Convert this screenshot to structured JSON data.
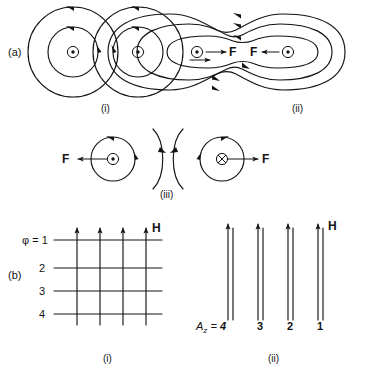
{
  "figure": {
    "panels": {
      "a": {
        "label": "(a)",
        "sub_i": {
          "caption": "(i)",
          "description": "two-parallel-currents-separate-field-circles",
          "current_symbols": [
            "dot-out-of-page",
            "dot-out-of-page"
          ],
          "circulation": "counterclockwise"
        },
        "sub_ii": {
          "caption": "(ii)",
          "description": "merged-field-contours-attraction",
          "force_label_left": "F",
          "force_label_right": "F",
          "current_symbols": [
            "dot-out-of-page",
            "dot-out-of-page"
          ],
          "force_direction": "inward-attraction"
        },
        "sub_iii": {
          "caption": "(iii)",
          "description": "antiparallel-currents-repulsion",
          "force_label_left": "F",
          "force_label_right": "F",
          "current_symbol_left": "dot-out-of-page",
          "current_symbol_right": "cross-into-page",
          "force_direction": "outward-repulsion"
        },
        "transition_arrow": "arrow-right"
      },
      "b": {
        "label": "(b)",
        "sub_i": {
          "caption": "(i)",
          "field_label": "H",
          "flux_prefix": "φ = ",
          "flux_levels": [
            "1",
            "2",
            "3",
            "4"
          ],
          "vertical_line_count": 4,
          "horizontal_line_count": 4,
          "arrow_direction": "up"
        },
        "sub_ii": {
          "caption": "(ii)",
          "field_label": "H",
          "potential_prefix": "A",
          "potential_subscript": "z",
          "potential_equals": " = ",
          "potential_levels": [
            "4",
            "3",
            "2",
            "1"
          ],
          "line_pair_count": 4,
          "arrow_direction": "up"
        }
      }
    },
    "colors": {
      "ink": "#141414",
      "background": "#ffffff"
    }
  }
}
